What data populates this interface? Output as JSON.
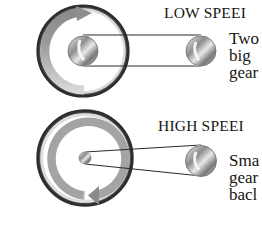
{
  "sections": [
    {
      "id": "low-speed",
      "heading": "LOW SPEEI",
      "body_lines": [
        "Two",
        "big",
        "gear"
      ]
    },
    {
      "id": "high-speed",
      "heading": "HIGH SPEEI",
      "body_lines": [
        "Sma",
        "gear",
        "bacl"
      ]
    }
  ],
  "colors": {
    "ring_dark": "#3a3a3a",
    "ring_light": "#d9d9d9",
    "arrow_gray": "#9a9a9a",
    "belt": "#2a2a2a",
    "text": "#161616"
  }
}
